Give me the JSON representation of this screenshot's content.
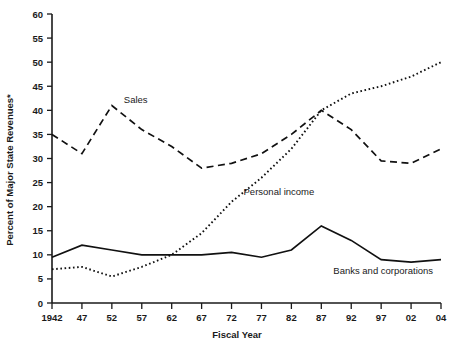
{
  "chart_data": {
    "type": "line",
    "title": "",
    "subtitle": "",
    "xlabel": "Fiscal Year",
    "ylabel": "Percent of Major State Revenues*",
    "x": [
      "1942",
      "47",
      "52",
      "57",
      "62",
      "67",
      "72",
      "77",
      "82",
      "87",
      "92",
      "97",
      "02",
      "04"
    ],
    "categories": [
      "1942",
      "47",
      "52",
      "57",
      "62",
      "67",
      "72",
      "77",
      "82",
      "87",
      "92",
      "97",
      "02",
      "04"
    ],
    "ylim": [
      0,
      60
    ],
    "yticks": [
      0,
      5,
      10,
      15,
      20,
      25,
      30,
      35,
      40,
      45,
      50,
      55,
      60
    ],
    "grid": false,
    "legend_position": "inline-annotation",
    "series": [
      {
        "name": "Sales",
        "style": "dashed",
        "values": [
          35,
          31,
          41,
          36,
          32.5,
          28,
          29,
          31,
          35,
          40,
          36,
          29.5,
          29,
          32
        ],
        "label_x": "52",
        "label_value": 41.5
      },
      {
        "name": "Personal income",
        "style": "dotted",
        "values": [
          7,
          7.5,
          5.5,
          7.5,
          10,
          14.5,
          21,
          26,
          32,
          40,
          43.5,
          45,
          47,
          50
        ],
        "label_x": "72",
        "label_value": 22.5
      },
      {
        "name": "Banks and corporations",
        "style": "solid",
        "values": [
          9.5,
          12,
          11,
          10,
          10,
          10,
          10.5,
          9.5,
          11,
          16,
          13,
          9,
          8.5,
          9
        ],
        "label_x": "87",
        "label_value": 6
      }
    ]
  },
  "axis": {
    "y_tick_labels": [
      "60",
      "55",
      "50",
      "45",
      "40",
      "35",
      "30",
      "25",
      "20",
      "15",
      "10",
      "5",
      "0"
    ],
    "x_tick_labels": [
      "1942",
      "47",
      "52",
      "57",
      "62",
      "67",
      "72",
      "77",
      "82",
      "87",
      "92",
      "97",
      "02",
      "04"
    ],
    "x_axis_title": "Fiscal Year",
    "y_axis_title": "Percent of Major State Revenues*"
  },
  "annotations": [
    {
      "name": "sales",
      "text": "Sales"
    },
    {
      "name": "personal-income",
      "text": "Personal income"
    },
    {
      "name": "banks-and-corporations",
      "text": "Banks and corporations"
    }
  ],
  "colors": {
    "ink": "#111111",
    "background": "#ffffff"
  }
}
